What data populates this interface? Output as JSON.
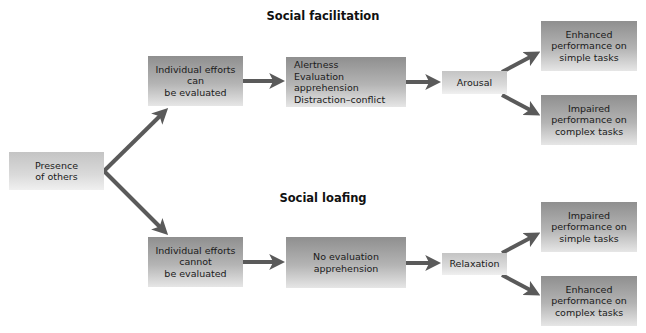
{
  "diagram": {
    "sections": [
      {
        "title": "Social facilitation",
        "start_condition": "Individual efforts\ncan\nbe evaluated",
        "mediator": "Alertness\nEvaluation apprehension\nDistraction–conflict",
        "state": "Arousal",
        "outcomes": [
          "Enhanced\nperformance on\nsimple tasks",
          "Impaired\nperformance on\ncomplex tasks"
        ]
      },
      {
        "title": "Social loafing",
        "start_condition": "Individual efforts\ncannot\nbe evaluated",
        "mediator": "No evaluation\napprehension",
        "state": "Relaxation",
        "outcomes": [
          "Impaired\nperformance on\nsimple tasks",
          "Enhanced\nperformance on\ncomplex tasks"
        ]
      }
    ],
    "root": "Presence\nof others",
    "colors": {
      "arrow": "#5a5a5a",
      "box_dark_top": "#8f8f8f",
      "box_light": "#dadada"
    }
  }
}
